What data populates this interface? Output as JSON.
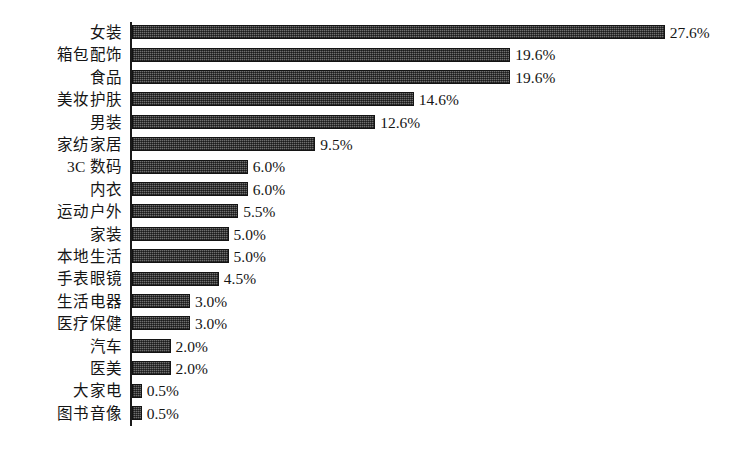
{
  "chart_data": {
    "type": "bar",
    "orientation": "horizontal",
    "title": "",
    "subtitle": "",
    "xlabel": "",
    "ylabel": "",
    "grid": false,
    "legend": false,
    "legend_position": "none",
    "xlim": [
      0,
      27.6
    ],
    "value_suffix": "%",
    "categories": [
      "女装",
      "箱包配饰",
      "食品",
      "美妆护肤",
      "男装",
      "家纺家居",
      "3C 数码",
      "内衣",
      "运动户外",
      "家装",
      "本地生活",
      "手表眼镜",
      "生活电器",
      "医疗保健",
      "汽车",
      "医美",
      "大家电",
      "图书音像"
    ],
    "values": [
      27.6,
      19.6,
      19.6,
      14.6,
      12.6,
      9.5,
      6.0,
      6.0,
      5.5,
      5.0,
      5.0,
      4.5,
      3.0,
      3.0,
      2.0,
      2.0,
      0.5,
      0.5
    ],
    "value_labels": [
      "27.6%",
      "19.6%",
      "19.6%",
      "14.6%",
      "12.6%",
      "9.5%",
      "6.0%",
      "6.0%",
      "5.5%",
      "5.0%",
      "5.0%",
      "4.5%",
      "3.0%",
      "3.0%",
      "2.0%",
      "2.0%",
      "0.5%",
      "0.5%"
    ],
    "bar_color": "#6f6f6f",
    "bar_edge_color": "#141414",
    "axis_color": "#1a1a1a",
    "background_color": "#ffffff",
    "text_color": "#151515"
  }
}
